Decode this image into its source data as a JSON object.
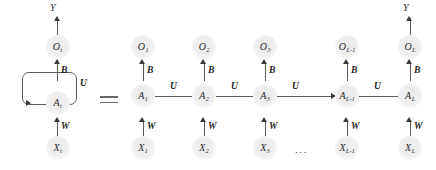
{
  "figure": {
    "equals_sign": "=",
    "ellipsis": "...",
    "colors": {
      "node_fill": "#eeeeee",
      "line": "#5c5c5c",
      "arrowhead": "#3a3a3a",
      "text": "#2b2b2b",
      "weight_text": "#1e1e1e"
    }
  },
  "folded": {
    "output_label": "Y",
    "nodes": {
      "output": {
        "base": "O",
        "sub": "t"
      },
      "hidden": {
        "base": "A",
        "sub": "t"
      },
      "input": {
        "base": "X",
        "sub": "t"
      }
    },
    "weights": {
      "hidden_to_output": "B",
      "input_to_hidden": "W",
      "recurrent": "U"
    }
  },
  "unrolled": {
    "output_label": "Y",
    "recurrent_weight": "U",
    "hidden_to_output_weight": "B",
    "input_to_hidden_weight": "W",
    "steps": [
      {
        "index": "1",
        "output": {
          "base": "O",
          "sub": "1"
        },
        "hidden": {
          "base": "A",
          "sub": "1"
        },
        "input": {
          "base": "X",
          "sub": "1"
        }
      },
      {
        "index": "2",
        "output": {
          "base": "O",
          "sub": "2"
        },
        "hidden": {
          "base": "A",
          "sub": "2"
        },
        "input": {
          "base": "X",
          "sub": "2"
        }
      },
      {
        "index": "3",
        "output": {
          "base": "O",
          "sub": "3"
        },
        "hidden": {
          "base": "A",
          "sub": "3"
        },
        "input": {
          "base": "X",
          "sub": "3"
        }
      },
      {
        "index": "L-1",
        "output": {
          "base": "O",
          "sub": "L-1"
        },
        "hidden": {
          "base": "A",
          "sub": "L-1"
        },
        "input": {
          "base": "X",
          "sub": "L-1"
        }
      },
      {
        "index": "L",
        "output": {
          "base": "O",
          "sub": "L"
        },
        "hidden": {
          "base": "A",
          "sub": "L"
        },
        "input": {
          "base": "X",
          "sub": "L"
        }
      }
    ]
  }
}
